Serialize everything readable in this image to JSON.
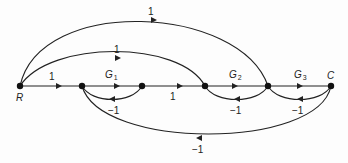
{
  "graph": {
    "title": "Signal flow graph",
    "colors": {
      "line": "#222222",
      "node": "#111111",
      "background": "#fdfdfd"
    },
    "nodes": [
      {
        "id": "R",
        "label": "R",
        "x": 20,
        "y": 86
      },
      {
        "id": "n2",
        "label": "",
        "x": 82,
        "y": 86
      },
      {
        "id": "n3",
        "label": "",
        "x": 142,
        "y": 86
      },
      {
        "id": "n4",
        "label": "",
        "x": 205,
        "y": 86
      },
      {
        "id": "n5",
        "label": "",
        "x": 268,
        "y": 86
      },
      {
        "id": "C",
        "label": "C",
        "x": 331,
        "y": 86
      }
    ],
    "branches": [
      {
        "from": "R",
        "to": "n2",
        "gain": "1"
      },
      {
        "from": "n2",
        "to": "n3",
        "gain_symbol": "G",
        "gain_sub": "1"
      },
      {
        "from": "n3",
        "to": "n4",
        "gain": "1"
      },
      {
        "from": "n4",
        "to": "n5",
        "gain_symbol": "G",
        "gain_sub": "2"
      },
      {
        "from": "n5",
        "to": "C",
        "gain_symbol": "G",
        "gain_sub": "3"
      },
      {
        "from": "n3",
        "to": "n2",
        "gain": "−1"
      },
      {
        "from": "n5",
        "to": "n4",
        "gain": "−1"
      },
      {
        "from": "C",
        "to": "n5",
        "gain": "−1"
      },
      {
        "from": "C",
        "to": "n2",
        "gain": "−1"
      },
      {
        "from": "R",
        "to": "n4",
        "gain": "1"
      },
      {
        "from": "R",
        "to": "n5",
        "gain": "1"
      }
    ],
    "labels": {
      "node_R": "R",
      "node_C": "C",
      "fwd_R_n2": "1",
      "fwd_n3_n4": "1",
      "G1": "G",
      "G1_sub": "1",
      "G2": "G",
      "G2_sub": "2",
      "G3": "G",
      "G3_sub": "3",
      "fb_n3_n2": "−1",
      "fb_n5_n4": "−1",
      "fb_C_n5": "−1",
      "fb_C_n2": "−1",
      "ff_R_n4": "1",
      "ff_R_n5": "1"
    }
  }
}
